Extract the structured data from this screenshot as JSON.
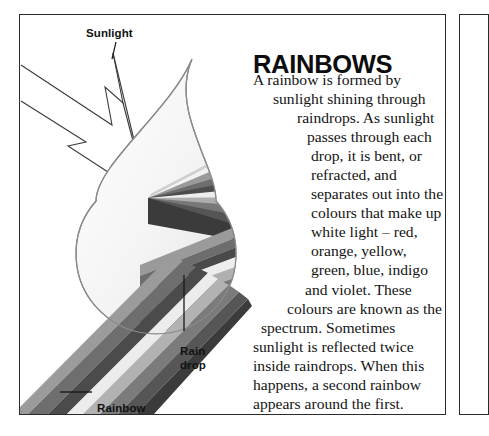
{
  "article": {
    "title": "RAINBOWS",
    "body": "A rainbow is formed by sunlight shining through raindrops. As sunlight passes through each drop, it is bent, or refracted, and separates out into the colours that make up white light – red, orange, yellow, green, blue, indigo and violet. These colours are known as the spectrum. Sometimes sunlight is reflected twice inside raindrops. When this happens, a second rainbow appears around the first."
  },
  "diagram": {
    "labels": {
      "sunlight": "Sunlight",
      "raindrop": "Rain\ndrop",
      "rainbow": "Rainbow"
    },
    "spectrum_bands": [
      "#8e8e8e",
      "#6f6f6f",
      "#4a4a4a",
      "#e8e8e8",
      "#b4b4b4",
      "#767676",
      "#585858",
      "#3d3d3d"
    ],
    "drop_outline_color": "#8a8a8a",
    "ray_color": "#3a3a3a"
  },
  "colors": {
    "border": "#2b2b2b",
    "text": "#141414",
    "title": "#0d0d0d",
    "background": "#ffffff"
  }
}
